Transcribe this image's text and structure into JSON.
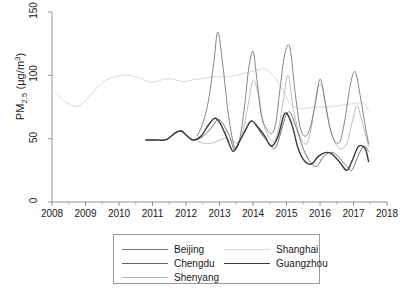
{
  "chart_data": {
    "type": "line",
    "title": "",
    "xlabel": "",
    "ylabel": "PM2.5 (μg/m³)",
    "ylabel_parts": {
      "prefix": "PM",
      "sub": "2.5",
      "unit_open": " (μg/m",
      "sup": "3",
      "unit_close": ")"
    },
    "xlim": [
      2008,
      2018
    ],
    "ylim": [
      0,
      150
    ],
    "xticks": [
      2008,
      2009,
      2010,
      2011,
      2012,
      2013,
      2014,
      2015,
      2016,
      2017,
      2018
    ],
    "xtick_labels": [
      "2008",
      "2009",
      "2010",
      "2011",
      "2012",
      "2013",
      "2014",
      "2015",
      "2016",
      "2017",
      "2018"
    ],
    "yticks": [
      0,
      50,
      100,
      150
    ],
    "ytick_labels": [
      "0",
      "50",
      "100",
      "150"
    ],
    "grid": false,
    "legend_position": "below-center",
    "legend_columns": 2,
    "series": [
      {
        "name": "Beijing",
        "color": "#777777",
        "width": 0.9,
        "x": [
          2012.33,
          2012.5,
          2012.67,
          2012.83,
          2012.95,
          2013.1,
          2013.25,
          2013.4,
          2013.5,
          2013.62,
          2013.75,
          2013.87,
          2014.0,
          2014.12,
          2014.25,
          2014.4,
          2014.55,
          2014.68,
          2014.8,
          2014.95,
          2015.1,
          2015.25,
          2015.4,
          2015.55,
          2015.7,
          2015.85,
          2016.0,
          2016.15,
          2016.3,
          2016.45,
          2016.6,
          2016.75,
          2016.9,
          2017.05,
          2017.2,
          2017.35,
          2017.45
        ],
        "y": [
          52,
          62,
          80,
          110,
          134,
          108,
          72,
          48,
          42,
          52,
          76,
          105,
          119,
          96,
          68,
          58,
          54,
          62,
          88,
          117,
          122,
          88,
          60,
          52,
          58,
          76,
          97,
          80,
          58,
          48,
          48,
          66,
          92,
          103,
          84,
          60,
          46
        ]
      },
      {
        "name": "Chengdu",
        "color": "#666666",
        "width": 0.9,
        "x": [
          2010.8,
          2011.0,
          2011.2,
          2011.45,
          2011.7,
          2011.9,
          2012.0,
          2012.2,
          2012.4,
          2012.6,
          2012.8,
          2012.95,
          2013.1,
          2013.3,
          2013.45,
          2013.6,
          2013.8,
          2013.95,
          2014.1,
          2014.3,
          2014.5,
          2014.65,
          2014.8,
          2014.95,
          2015.1,
          2015.3,
          2015.5,
          2015.7,
          2015.9,
          2016.05,
          2016.2,
          2016.4,
          2016.6,
          2016.8,
          2016.95,
          2017.1,
          2017.3,
          2017.45
        ],
        "y": [
          49,
          49,
          49,
          50,
          55,
          56,
          53,
          49,
          50,
          54,
          60,
          65,
          62,
          52,
          41,
          48,
          58,
          64,
          60,
          52,
          46,
          42,
          52,
          66,
          71,
          58,
          42,
          32,
          28,
          34,
          38,
          39,
          34,
          28,
          25,
          34,
          44,
          40
        ]
      },
      {
        "name": "Shenyang",
        "color": "#b5b5b5",
        "width": 0.9,
        "x": [
          2012.35,
          2012.6,
          2012.85,
          2013.0,
          2013.2,
          2013.4,
          2013.55,
          2013.7,
          2013.85,
          2014.0,
          2014.15,
          2014.3,
          2014.45,
          2014.6,
          2014.75,
          2014.9,
          2015.05,
          2015.2,
          2015.4,
          2015.6,
          2015.75,
          2015.9,
          2016.05,
          2016.2,
          2016.4,
          2016.6,
          2016.8,
          2016.95,
          2017.1,
          2017.25,
          2017.45
        ],
        "y": [
          48,
          46,
          47,
          49,
          50,
          48,
          47,
          56,
          76,
          96,
          86,
          64,
          52,
          48,
          56,
          80,
          100,
          74,
          52,
          46,
          60,
          86,
          92,
          70,
          50,
          42,
          46,
          62,
          76,
          64,
          44
        ]
      },
      {
        "name": "Shanghai",
        "color": "#cfcfcf",
        "width": 0.8,
        "x": [
          2008.1,
          2008.35,
          2008.6,
          2008.8,
          2009.0,
          2009.3,
          2009.6,
          2009.9,
          2010.1,
          2010.35,
          2010.6,
          2010.9,
          2011.1,
          2011.35,
          2011.6,
          2011.9,
          2012.1,
          2012.35,
          2012.6,
          2012.9,
          2013.2,
          2013.5,
          2013.8,
          2014.1,
          2014.35,
          2014.6,
          2014.9,
          2015.1,
          2015.35,
          2015.6,
          2015.9,
          2016.2,
          2016.5,
          2016.8,
          2017.1,
          2017.3,
          2017.45
        ],
        "y": [
          87,
          80,
          76,
          76,
          80,
          89,
          96,
          99,
          100,
          100,
          98,
          95,
          95,
          97,
          97,
          95,
          96,
          97,
          98,
          99,
          99,
          100,
          102,
          104,
          105,
          100,
          88,
          78,
          74,
          74,
          75,
          75,
          76,
          77,
          78,
          78,
          72
        ]
      },
      {
        "name": "Guangzhou",
        "color": "#3a3a3a",
        "width": 1.4,
        "x": [
          2010.8,
          2011.1,
          2011.4,
          2011.65,
          2011.85,
          2012.0,
          2012.2,
          2012.45,
          2012.65,
          2012.85,
          2013.0,
          2013.2,
          2013.4,
          2013.6,
          2013.8,
          2013.95,
          2014.15,
          2014.35,
          2014.55,
          2014.75,
          2014.95,
          2015.15,
          2015.35,
          2015.55,
          2015.75,
          2015.95,
          2016.15,
          2016.35,
          2016.6,
          2016.8,
          2016.95,
          2017.15,
          2017.35,
          2017.45
        ],
        "y": [
          49,
          49,
          49,
          54,
          56,
          53,
          49,
          52,
          60,
          66,
          63,
          52,
          40,
          48,
          58,
          64,
          59,
          52,
          44,
          52,
          70,
          62,
          42,
          32,
          30,
          36,
          39,
          38,
          31,
          25,
          32,
          44,
          42,
          32
        ]
      }
    ]
  },
  "legend": {
    "entries": [
      {
        "label": "Beijing",
        "color": "#777777",
        "width": 0.9
      },
      {
        "label": "Chengdu",
        "color": "#666666",
        "width": 0.9
      },
      {
        "label": "Shenyang",
        "color": "#b5b5b5",
        "width": 0.9
      },
      {
        "label": "Shanghai",
        "color": "#d8d8d8",
        "width": 0.8
      },
      {
        "label": "Guangzhou",
        "color": "#3a3a3a",
        "width": 1.4
      }
    ]
  },
  "axes": {
    "frame_color": "#888888",
    "tick_color": "#888888",
    "text_color": "#1a1a1a"
  }
}
